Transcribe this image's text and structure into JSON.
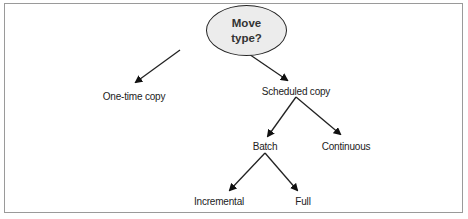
{
  "diagram": {
    "type": "decision-tree",
    "root": {
      "label": "Move\ntype?"
    },
    "nodes": [
      {
        "id": "one-time-copy",
        "label": "One-time copy",
        "parent": "root"
      },
      {
        "id": "scheduled-copy",
        "label": "Scheduled copy",
        "parent": "root"
      },
      {
        "id": "batch",
        "label": "Batch",
        "parent": "scheduled-copy"
      },
      {
        "id": "continuous",
        "label": "Continuous",
        "parent": "scheduled-copy"
      },
      {
        "id": "incremental",
        "label": "Incremental",
        "parent": "batch"
      },
      {
        "id": "full",
        "label": "Full",
        "parent": "batch"
      }
    ],
    "colors": {
      "root_fill": "#ececec",
      "stroke": "#222222",
      "frame": "#9a9a9a"
    }
  }
}
